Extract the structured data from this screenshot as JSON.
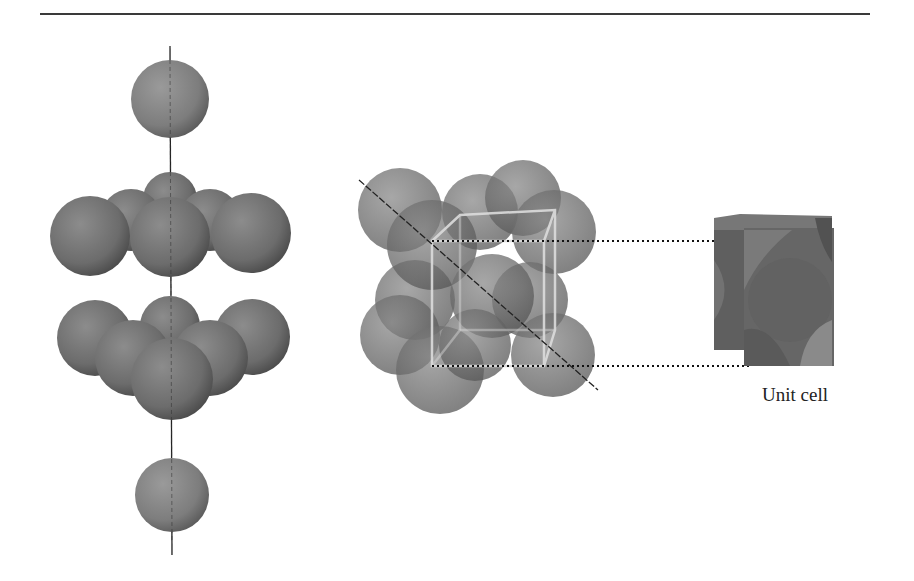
{
  "figure": {
    "labels": {
      "unit_cell": "Unit cell"
    },
    "colors": {
      "sphere": "#6e6e6e",
      "sphere_light": "#8a8a8a",
      "sphere_dark": "#4a4a4a",
      "axis": "#222222",
      "rule": "#3a3a3a",
      "cube_edge": "#d8d8d8"
    },
    "panels": [
      {
        "name": "layer-stack",
        "layers": [
          "single sphere",
          "6-sphere layer",
          "6-sphere layer",
          "single sphere"
        ]
      },
      {
        "name": "packed-cube",
        "spheres": 14,
        "has_body_diagonal": true
      },
      {
        "name": "unit-cell",
        "caption": "Unit cell"
      }
    ]
  }
}
